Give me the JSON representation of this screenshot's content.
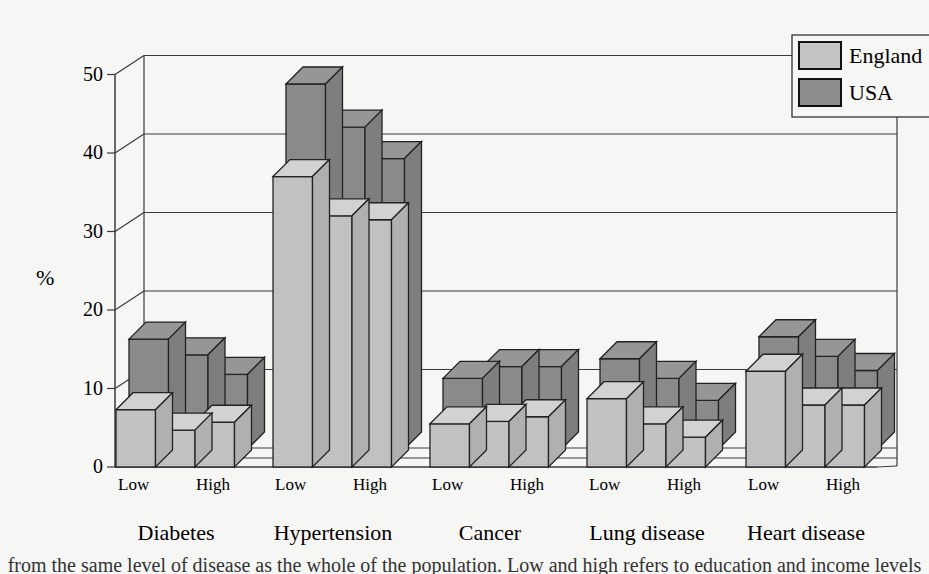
{
  "chart_data": {
    "type": "bar",
    "style": "3d-grouped",
    "title": "",
    "xlabel": "",
    "ylabel": "%",
    "ylim": [
      0,
      50
    ],
    "yticks": [
      0,
      10,
      20,
      30,
      40,
      50
    ],
    "grid": true,
    "legend_position": "top-right",
    "categories": [
      "Diabetes",
      "Hypertension",
      "Cancer",
      "Lung disease",
      "Heart disease"
    ],
    "subcategories": [
      "Low",
      "Mid",
      "High"
    ],
    "subcategory_labels_shown": [
      "Low",
      "High"
    ],
    "series": [
      {
        "name": "England",
        "color": "#c4c4c4",
        "values": [
          [
            7.3,
            4.7,
            5.7
          ],
          [
            37.0,
            32.0,
            31.5
          ],
          [
            5.5,
            5.8,
            6.4
          ],
          [
            8.7,
            5.5,
            3.8
          ],
          [
            12.2,
            7.9,
            7.9
          ]
        ]
      },
      {
        "name": "USA",
        "color": "#8c8c8c",
        "values": [
          [
            14.0,
            12.0,
            9.5
          ],
          [
            46.5,
            41.0,
            37.0
          ],
          [
            9.0,
            10.5,
            10.5
          ],
          [
            11.5,
            9.0,
            6.2
          ],
          [
            14.3,
            11.8,
            10.0
          ]
        ]
      }
    ]
  },
  "axis": {
    "y_label": "%",
    "y_ticks": [
      "0",
      "10",
      "20",
      "30",
      "40",
      "50"
    ],
    "low_label": "Low",
    "high_label": "High"
  },
  "legend": {
    "items": [
      {
        "label": "England",
        "color": "#c4c4c4"
      },
      {
        "label": "USA",
        "color": "#8c8c8c"
      }
    ]
  },
  "caption": "from the same level of disease as the whole of the population. Low and high refers to education and income levels"
}
